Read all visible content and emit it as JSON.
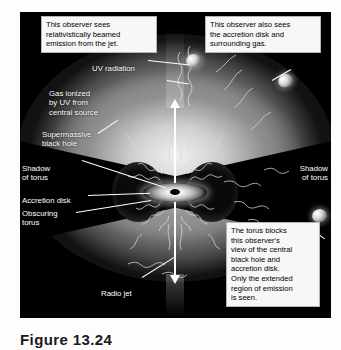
{
  "figure": {
    "domain": "astronomy-diagram",
    "caption": "Figure 13.24",
    "panel_background": "#000000",
    "accent_colors": {
      "callout_background": "#f7f7f7",
      "callout_border": "#b4b4b4",
      "label_text": "#ffffff",
      "jet": "#ffffff",
      "gas_bright": "#e8e8e8",
      "torus_shadow": "#000000"
    }
  },
  "callouts": [
    {
      "id": "observer-jet",
      "lines": [
        "This observer sees",
        "relativistically beamed",
        "emission from the jet."
      ]
    },
    {
      "id": "observer-disk",
      "lines": [
        "This observer also sees",
        "the accretion disk and",
        "surrounding gas."
      ]
    },
    {
      "id": "observer-blocked",
      "lines": [
        "The torus blocks",
        "this observer's",
        "view of the central",
        "black hole and",
        "accretion disk.",
        "Only the extended",
        "region of emission",
        "is seen."
      ]
    }
  ],
  "labels": [
    {
      "id": "uv-radiation",
      "text": "UV radiation"
    },
    {
      "id": "gas-ionized",
      "text": "Gas ionized\nby UV from\ncentral source"
    },
    {
      "id": "supermassive-bh",
      "text": "Supermassive\nblack hole"
    },
    {
      "id": "shadow-left",
      "text": "Shadow\nof torus"
    },
    {
      "id": "shadow-right",
      "text": "Shadow\nof torus"
    },
    {
      "id": "accretion-disk",
      "text": "Accretion disk"
    },
    {
      "id": "obscuring-torus",
      "text": "Obscuring\ntorus"
    },
    {
      "id": "radio-jet",
      "text": "Radio jet"
    }
  ],
  "observers": [
    {
      "id": "observer-icon-top",
      "sees": "relativistically beamed jet emission"
    },
    {
      "id": "observer-icon-upper-right",
      "sees": "accretion disk and surrounding gas"
    },
    {
      "id": "observer-icon-right",
      "sees": "extended emission region only"
    }
  ]
}
